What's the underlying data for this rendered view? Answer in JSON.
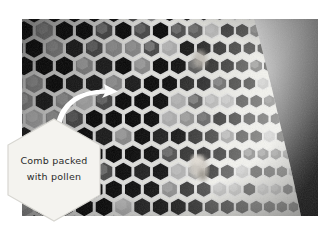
{
  "figure": {
    "kind": "photograph",
    "palette": "black-and-white",
    "background_color": "#ffffff"
  },
  "photo": {
    "name": "honeycomb-photograph",
    "description": "Black and white close-up photograph of a beeswax honeycomb seen at an angle. Most hexagonal cells are deep black and empty; many cells are filled with lighter grey pollen. Cells shrink toward the right edge with perspective and the upper-right corner falls away into an out-of-focus grey gradient.",
    "frame": {
      "x": 22,
      "y": 19,
      "width": 296,
      "height": 197
    },
    "tones": {
      "empty_cell": "#070707",
      "pollen_cell": "#8d8d8d",
      "cell_wall": "#e6e6e6",
      "background_blur_light": "#d8d8d8",
      "background_blur_dark": "#3a3a3a"
    }
  },
  "callout": {
    "name": "comb-pollen-callout",
    "shape": "hexagon",
    "fill_color": "#f4f3ef",
    "edge_color": "#d7d6d1",
    "text_color": "#2a2a2a",
    "lines": [
      "Comb packed",
      "with pollen"
    ]
  },
  "arrow": {
    "name": "callout-arrow",
    "color": "#ffffff",
    "direction": "up-right",
    "style": "curved-tapered"
  }
}
